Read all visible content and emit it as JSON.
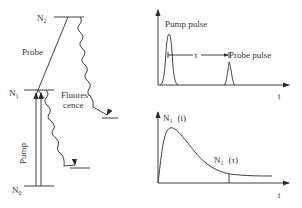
{
  "energy_diagram": {
    "levels": {
      "n2": "N",
      "n2_sub": "2",
      "n1": "N",
      "n1_sub": "1",
      "n0": "N",
      "n0_sub": "0"
    },
    "probe_label": "Probe",
    "pump_label": "Pump",
    "fluorescence_line1": "Fluores-",
    "fluorescence_line2": "cence"
  },
  "pulse_plot": {
    "pump_label": "Pump pulse",
    "probe_label": "Probe pulse",
    "delay_label": "τ",
    "x_axis_label": "t"
  },
  "population_plot": {
    "curve_label": "N",
    "curve_label_sub": "1",
    "curve_label_arg": "(t)",
    "point_label": "N",
    "point_label_sub": "1",
    "point_label_arg": "(τ)",
    "x_axis_label": "t"
  },
  "colors": {
    "line": "#2a2a2a",
    "text": "#333333",
    "background": "#ffffff"
  }
}
